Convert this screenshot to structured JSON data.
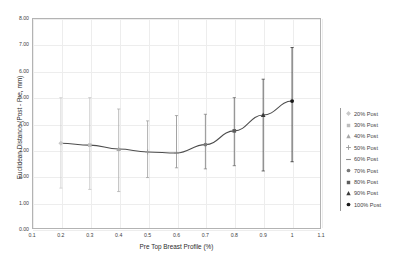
{
  "chart_data": {
    "type": "line",
    "title": "",
    "subtitle": "",
    "xlabel": "Pre Top Breast Profile (%)",
    "ylabel": "Euclidean Distance (Post - Pre, mm)",
    "xlim": [
      0.1,
      1.1
    ],
    "ylim": [
      0.0,
      8.0
    ],
    "xticks": [
      "0.1",
      "0.2",
      "0.3",
      "0.4",
      "0.5",
      "0.6",
      "0.7",
      "0.8",
      "0.9",
      "1",
      "1.1"
    ],
    "xtick_values": [
      0.1,
      0.2,
      0.3,
      0.4,
      0.5,
      0.6,
      0.7,
      0.8,
      0.9,
      1.0,
      1.1
    ],
    "yticks": [
      "0.00",
      "1.00",
      "2.00",
      "3.00",
      "4.00",
      "5.00",
      "6.00",
      "7.00",
      "8.00"
    ],
    "ytick_values": [
      0,
      1,
      2,
      3,
      4,
      5,
      6,
      7,
      8
    ],
    "grid": true,
    "legend_position": "right",
    "error_bars": true,
    "x": [
      0.2,
      0.3,
      0.4,
      0.5,
      0.6,
      0.7,
      0.8,
      0.9,
      1.0
    ],
    "values": [
      3.25,
      3.18,
      3.03,
      2.92,
      2.88,
      3.2,
      3.72,
      4.32,
      4.85
    ],
    "error_low": [
      1.55,
      1.5,
      1.42,
      1.95,
      2.32,
      2.28,
      2.4,
      2.2,
      2.55
    ],
    "error_high": [
      4.98,
      4.98,
      4.55,
      4.1,
      4.3,
      4.35,
      4.98,
      5.68,
      6.88
    ],
    "points": [
      {
        "x": 0.2,
        "y": 3.25,
        "low": 1.55,
        "high": 4.98,
        "label": "20% Post",
        "marker": "diamond",
        "color": "#c9c9c9"
      },
      {
        "x": 0.3,
        "y": 3.18,
        "low": 1.5,
        "high": 4.98,
        "label": "30% Post",
        "marker": "square",
        "color": "#bdbdbd"
      },
      {
        "x": 0.4,
        "y": 3.03,
        "low": 1.42,
        "high": 4.55,
        "label": "40% Post",
        "marker": "triangle",
        "color": "#a8a8a8"
      },
      {
        "x": 0.5,
        "y": 2.92,
        "low": 1.95,
        "high": 4.1,
        "label": "50% Post",
        "marker": "cross",
        "color": "#9b9b9b"
      },
      {
        "x": 0.6,
        "y": 2.88,
        "low": 2.32,
        "high": 4.3,
        "label": "60% Post",
        "marker": "dash",
        "color": "#8d8d8d"
      },
      {
        "x": 0.7,
        "y": 3.2,
        "low": 2.28,
        "high": 4.35,
        "label": "70% Post",
        "marker": "circle",
        "color": "#7a7a7a"
      },
      {
        "x": 0.8,
        "y": 3.72,
        "low": 2.4,
        "high": 4.98,
        "label": "80% Post",
        "marker": "square",
        "color": "#5c5c5c"
      },
      {
        "x": 0.9,
        "y": 4.32,
        "low": 2.2,
        "high": 5.68,
        "label": "90% Post",
        "marker": "triangle",
        "color": "#3a3a3a"
      },
      {
        "x": 1.0,
        "y": 4.85,
        "low": 2.55,
        "high": 6.88,
        "label": "100% Post",
        "marker": "circle",
        "color": "#1a1a1a"
      }
    ],
    "line_color": "#4d4d4d"
  },
  "legend": {
    "items": [
      {
        "label": "20% Post",
        "marker": "diamond",
        "color": "#c9c9c9"
      },
      {
        "label": "30% Post",
        "marker": "square",
        "color": "#bdbdbd"
      },
      {
        "label": "40% Post",
        "marker": "triangle",
        "color": "#a8a8a8"
      },
      {
        "label": "50% Post",
        "marker": "cross",
        "color": "#9b9b9b"
      },
      {
        "label": "60% Post",
        "marker": "dash",
        "color": "#8d8d8d"
      },
      {
        "label": "70% Post",
        "marker": "circle",
        "color": "#7a7a7a"
      },
      {
        "label": "80% Post",
        "marker": "square",
        "color": "#5c5c5c"
      },
      {
        "label": "90% Post",
        "marker": "triangle",
        "color": "#3a3a3a"
      },
      {
        "label": "100% Post",
        "marker": "circle",
        "color": "#1a1a1a"
      }
    ]
  },
  "colors": {
    "grid": "#ededed",
    "frame": "#b3b3b3",
    "axis_text": "#3f3f3f",
    "label_text": "#2b2b2b",
    "line": "#4d4d4d",
    "error_bar_light": "#cccccc",
    "error_bar_dark": "#4a4a4a"
  }
}
